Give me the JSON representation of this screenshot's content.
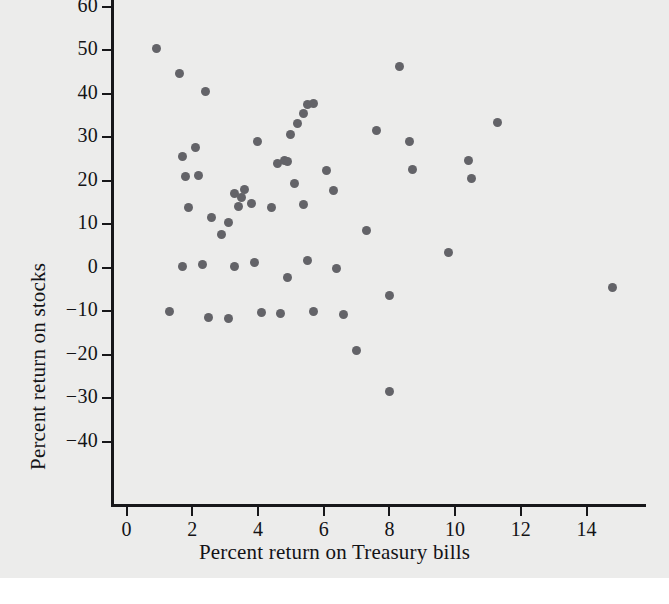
{
  "chart_data": {
    "type": "scatter",
    "title": "",
    "xlabel": "Percent return on Treasury bills",
    "ylabel": "Percent return on stocks",
    "xlim": [
      -0.6,
      15.6
    ],
    "ylim": [
      -45,
      65
    ],
    "xticks": [
      0,
      2,
      4,
      6,
      8,
      10,
      12,
      14
    ],
    "xtick_labels": [
      "0",
      "2",
      "4",
      "6",
      "8",
      "10",
      "12",
      "14"
    ],
    "yticks": [
      -40,
      -30,
      -20,
      -10,
      0,
      10,
      20,
      30,
      40,
      50,
      60
    ],
    "ytick_labels": [
      "−40",
      "−30",
      "−20",
      "−10",
      "0",
      "10",
      "20",
      "30",
      "40",
      "50",
      "60"
    ],
    "grid": false,
    "legend": false,
    "marker": {
      "shape": "circle",
      "color": "#636368",
      "size_px": 9
    },
    "background_color": "#ececeb",
    "axis_color": "#17171a",
    "points": [
      {
        "x": 0.9,
        "y": 50.3
      },
      {
        "x": 1.6,
        "y": 44.6
      },
      {
        "x": 2.4,
        "y": 40.4
      },
      {
        "x": 1.3,
        "y": -10.2
      },
      {
        "x": 1.7,
        "y": 25.5
      },
      {
        "x": 1.8,
        "y": 21.0
      },
      {
        "x": 1.9,
        "y": 13.7
      },
      {
        "x": 2.1,
        "y": 27.6
      },
      {
        "x": 1.7,
        "y": 0.3
      },
      {
        "x": 2.3,
        "y": 0.8
      },
      {
        "x": 2.2,
        "y": 21.1
      },
      {
        "x": 2.6,
        "y": 11.4
      },
      {
        "x": 2.5,
        "y": -11.5
      },
      {
        "x": 2.9,
        "y": 7.5
      },
      {
        "x": 3.1,
        "y": -11.7
      },
      {
        "x": 3.1,
        "y": 10.4
      },
      {
        "x": 3.3,
        "y": 17.0
      },
      {
        "x": 3.5,
        "y": 16.0
      },
      {
        "x": 3.4,
        "y": 14.0
      },
      {
        "x": 3.6,
        "y": 17.9
      },
      {
        "x": 3.3,
        "y": 0.2
      },
      {
        "x": 3.8,
        "y": 14.6
      },
      {
        "x": 4.0,
        "y": 28.9
      },
      {
        "x": 3.9,
        "y": 1.1
      },
      {
        "x": 4.1,
        "y": -10.4
      },
      {
        "x": 4.4,
        "y": 13.8
      },
      {
        "x": 4.6,
        "y": 23.8
      },
      {
        "x": 4.8,
        "y": 24.5
      },
      {
        "x": 4.9,
        "y": 24.3
      },
      {
        "x": 5.0,
        "y": 30.5
      },
      {
        "x": 5.1,
        "y": 19.2
      },
      {
        "x": 4.9,
        "y": -2.2
      },
      {
        "x": 4.7,
        "y": -10.5
      },
      {
        "x": 5.2,
        "y": 33.2
      },
      {
        "x": 5.4,
        "y": 35.5
      },
      {
        "x": 5.5,
        "y": 37.4
      },
      {
        "x": 5.7,
        "y": 37.8
      },
      {
        "x": 5.4,
        "y": 14.4
      },
      {
        "x": 5.5,
        "y": 1.7
      },
      {
        "x": 5.7,
        "y": -10.0
      },
      {
        "x": 6.1,
        "y": 22.2
      },
      {
        "x": 6.3,
        "y": 17.7
      },
      {
        "x": 6.4,
        "y": -0.2
      },
      {
        "x": 6.6,
        "y": -10.9
      },
      {
        "x": 7.0,
        "y": -19.1
      },
      {
        "x": 7.3,
        "y": 8.6
      },
      {
        "x": 7.6,
        "y": 31.6
      },
      {
        "x": 8.0,
        "y": -6.5
      },
      {
        "x": 8.0,
        "y": -28.4
      },
      {
        "x": 8.3,
        "y": 46.3
      },
      {
        "x": 8.6,
        "y": 29.0
      },
      {
        "x": 8.7,
        "y": 22.5
      },
      {
        "x": 9.8,
        "y": 3.4
      },
      {
        "x": 10.4,
        "y": 24.5
      },
      {
        "x": 10.5,
        "y": 20.5
      },
      {
        "x": 11.3,
        "y": 33.4
      },
      {
        "x": 14.8,
        "y": -4.7
      }
    ]
  }
}
